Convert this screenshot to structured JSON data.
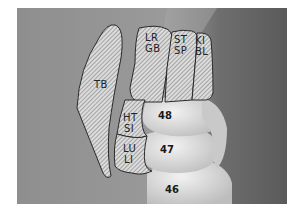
{
  "figure": {
    "regions": [
      {
        "id": "TB",
        "label": "TB"
      },
      {
        "id": "LR_GB",
        "label_line1": "LR",
        "label_line2": "GB"
      },
      {
        "id": "ST_SP",
        "label_line1": "ST",
        "label_line2": "SP"
      },
      {
        "id": "KI_BL",
        "label_line1": "KI",
        "label_line2": "BL"
      },
      {
        "id": "HT_SI",
        "label_line1": "HT",
        "label_line2": "SI"
      },
      {
        "id": "LU_LI",
        "label_line1": "LU",
        "label_line2": "LI"
      }
    ],
    "teeth": [
      {
        "number": "48"
      },
      {
        "number": "47"
      },
      {
        "number": "46"
      }
    ],
    "colors": {
      "background_photo": "#8a8a8a",
      "hatch_fill": "#d8d8d8",
      "hatch_stroke": "#666666",
      "outline": "#2a2a2a",
      "tooth": "#e4e4e4"
    }
  }
}
